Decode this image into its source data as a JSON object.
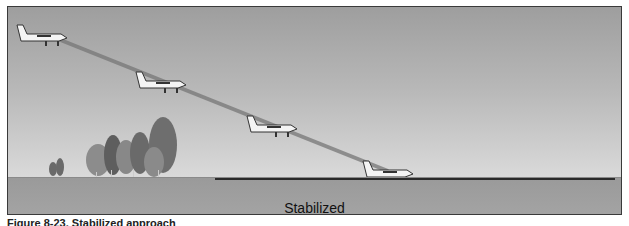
{
  "figure": {
    "label": "Stabilized",
    "caption": "Figure 8-23. Stabilized approach"
  },
  "scene": {
    "glidepath": {
      "from": [
        50,
        35
      ],
      "to": [
        385,
        168
      ],
      "color": "#7a7a7a"
    },
    "aircraft": [
      {
        "name": "aircraft-1",
        "x": 16,
        "y": 24
      },
      {
        "name": "aircraft-2",
        "x": 135,
        "y": 71
      },
      {
        "name": "aircraft-3",
        "x": 246,
        "y": 115
      },
      {
        "name": "aircraft-4",
        "x": 362,
        "y": 160
      }
    ],
    "colors": {
      "sky_top": "#9e9e9e",
      "sky_bottom": "#e2e2e2",
      "ground": "#a0a0a0",
      "runway": "#2a2a2a",
      "trees": "#777777"
    }
  }
}
